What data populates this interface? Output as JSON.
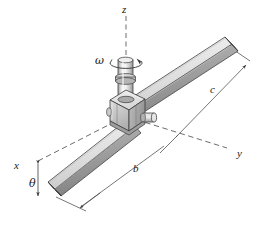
{
  "figure": {
    "background_color": "#ffffff",
    "width": 268,
    "height": 236
  },
  "labels": {
    "axis_z": "z",
    "axis_y": "y",
    "axis_x": "x",
    "angular_velocity": "ω",
    "angle_theta": "θ",
    "dimension_b": "b",
    "dimension_c": "c"
  },
  "colors": {
    "outline": "#3a3a3a",
    "bar_top_face": "#e8e8e8",
    "bar_front_face": "#9a9a9a",
    "bar_side_face": "#c4c4c4",
    "bar_dark_face": "#7c7c7c",
    "collar_light": "#e2e2e2",
    "collar_mid": "#bdbdbd",
    "collar_dark": "#8f8f8f",
    "shaft_light": "#ededed",
    "shaft_mid": "#b6b6b6",
    "dashed_line": "#555555",
    "dimension_line": "#4a4a4a",
    "text": "#1a1a1a"
  },
  "elements": {
    "bar_description": "square cross-section bar inclined through collar",
    "shaft_description": "vertical cylindrical shaft rotating about z axis",
    "collar_description": "block collar with side pin joining bar to shaft",
    "rotation_arrow": "circular arrow about z axis"
  }
}
